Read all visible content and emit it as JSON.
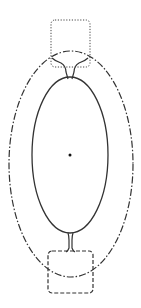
{
  "diagram": {
    "width": 141,
    "height": 308,
    "stroke_color": "#333333",
    "background": "#ffffff",
    "elements": [
      {
        "id": "outer-ellipse",
        "style": "dash-dot",
        "cx": 71,
        "cy": 164,
        "rx": 62,
        "ry": 113
      },
      {
        "id": "inner-ellipse",
        "style": "solid",
        "cx": 70,
        "cy": 155,
        "rx": 38,
        "ry": 78
      },
      {
        "id": "top-square",
        "style": "dotted",
        "x": 51,
        "y": 20,
        "w": 39,
        "h": 47
      },
      {
        "id": "bottom-square",
        "style": "dashed",
        "x": 48,
        "y": 251,
        "w": 45,
        "h": 42
      },
      {
        "id": "center-point",
        "cx": 70,
        "cy": 155,
        "r": 1.5
      }
    ]
  }
}
